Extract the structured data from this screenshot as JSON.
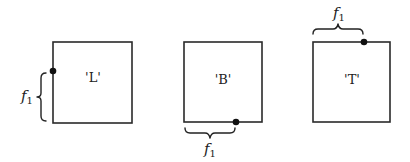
{
  "diagram": {
    "panels": [
      {
        "id": "L",
        "label": "'L'",
        "side": "left",
        "brace_label": "f",
        "brace_subscript": "1"
      },
      {
        "id": "B",
        "label": "'B'",
        "side": "bottom",
        "brace_label": "f",
        "brace_subscript": "1"
      },
      {
        "id": "T",
        "label": "'T'",
        "side": "top",
        "brace_label": "f",
        "brace_subscript": "1"
      }
    ],
    "colors": {
      "stroke": "#2a2a2a",
      "dot": "#111111",
      "background": "#ffffff"
    }
  }
}
